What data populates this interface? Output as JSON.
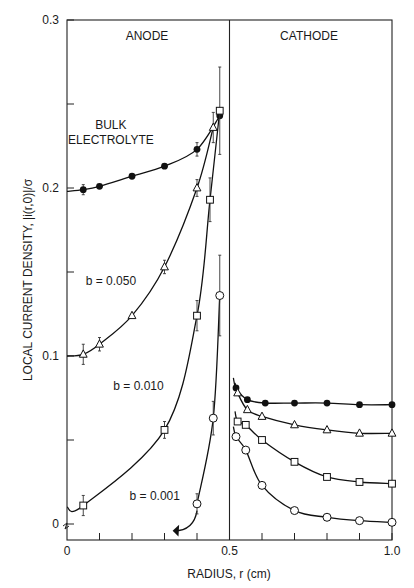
{
  "chart_data": {
    "type": "scatter",
    "title": "",
    "xlabel": "RADIUS, r (cm)",
    "ylabel": "LOCAL CURRENT DENSITY, |i(r,0)|/σ",
    "xlim": [
      0,
      1.0
    ],
    "ylim": [
      0,
      0.3
    ],
    "x_ticks": [
      "0",
      "0.5",
      "1.0"
    ],
    "y_ticks": [
      "0",
      "0.1",
      "0.2",
      "0.3"
    ],
    "x_minor_step": 0.1,
    "y_minor_step": 0.05,
    "grid": false,
    "legend_position": "inline annotations",
    "region_labels": [
      "ANODE",
      "CATHODE"
    ],
    "region_divider_x": 0.5,
    "annotations": [
      {
        "text": "BULK",
        "x": 0.135,
        "y": 0.235
      },
      {
        "text": "ELECTROLYTE",
        "x": 0.135,
        "y": 0.226
      },
      {
        "text": "b = 0.050",
        "x": 0.135,
        "y": 0.142
      },
      {
        "text": "b = 0.010",
        "x": 0.22,
        "y": 0.08
      },
      {
        "text": "b = 0.001",
        "x": 0.27,
        "y": 0.014
      }
    ],
    "series": [
      {
        "name": "Bulk electrolyte",
        "marker": "filled-circle",
        "anode": {
          "x": [
            0.05,
            0.1,
            0.2,
            0.3,
            0.4,
            0.47
          ],
          "y": [
            0.199,
            0.201,
            0.207,
            0.213,
            0.223,
            0.243
          ],
          "err": [
            0.003,
            0.0,
            0.0,
            0.0,
            0.004,
            0.0
          ]
        },
        "cathode": {
          "x": [
            0.52,
            0.555,
            0.61,
            0.7,
            0.8,
            0.9,
            1.0
          ],
          "y": [
            0.081,
            0.074,
            0.072,
            0.072,
            0.072,
            0.071,
            0.071
          ]
        }
      },
      {
        "name": "b = 0.050",
        "marker": "open-triangle",
        "anode": {
          "x": [
            0.05,
            0.1,
            0.2,
            0.3,
            0.4,
            0.45
          ],
          "y": [
            0.101,
            0.107,
            0.124,
            0.153,
            0.2,
            0.236
          ],
          "err": [
            0.006,
            0.004,
            0.0,
            0.004,
            0.005,
            0.009
          ]
        },
        "cathode": {
          "x": [
            0.525,
            0.555,
            0.6,
            0.7,
            0.8,
            0.9,
            1.0
          ],
          "y": [
            0.078,
            0.068,
            0.064,
            0.059,
            0.056,
            0.054,
            0.054
          ]
        }
      },
      {
        "name": "b = 0.010",
        "marker": "open-square",
        "anode": {
          "x": [
            0.05,
            0.3,
            0.4,
            0.44,
            0.47
          ],
          "y": [
            0.011,
            0.056,
            0.124,
            0.193,
            0.246
          ],
          "err": [
            0.006,
            0.005,
            0.009,
            0.013,
            0.026
          ]
        },
        "cathode": {
          "x": [
            0.525,
            0.55,
            0.6,
            0.7,
            0.8,
            0.9,
            1.0
          ],
          "y": [
            0.061,
            0.059,
            0.05,
            0.037,
            0.028,
            0.025,
            0.024
          ]
        }
      },
      {
        "name": "b = 0.001",
        "marker": "open-circle",
        "anode": {
          "x": [
            0.4,
            0.45,
            0.47
          ],
          "y": [
            0.012,
            0.063,
            0.136
          ],
          "err": [
            0.006,
            0.01,
            0.024
          ]
        },
        "cathode": {
          "x": [
            0.52,
            0.55,
            0.6,
            0.7,
            0.8,
            0.9,
            1.0
          ],
          "y": [
            0.052,
            0.044,
            0.023,
            0.008,
            0.004,
            0.002,
            0.001
          ]
        }
      }
    ]
  }
}
